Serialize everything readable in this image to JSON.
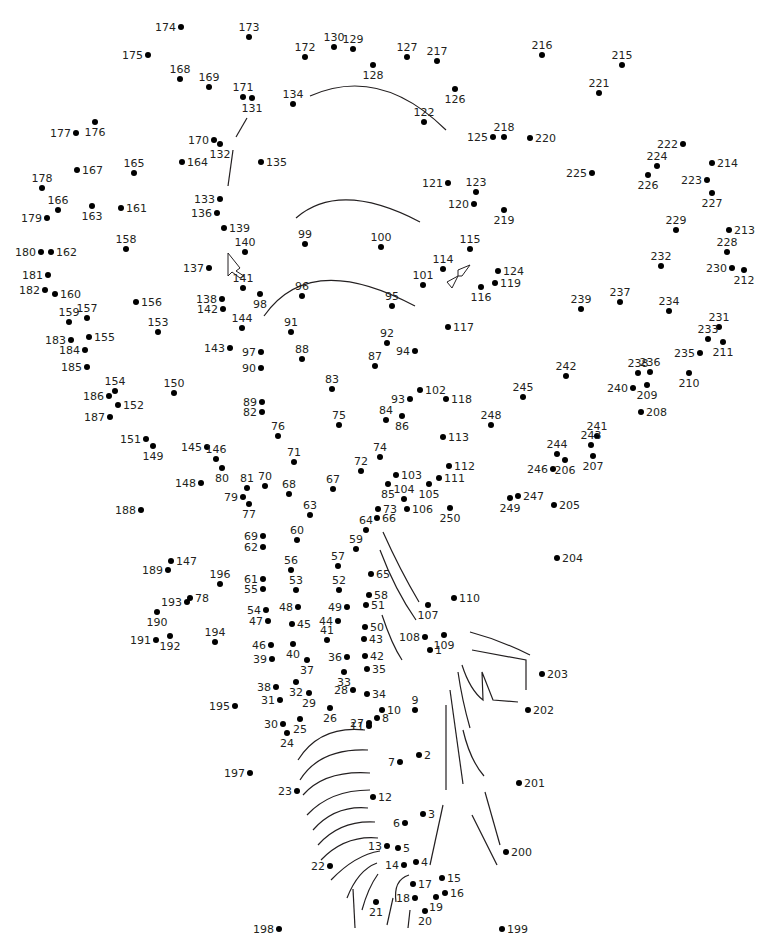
{
  "puzzle": {
    "type": "connect-the-dots",
    "dot_count": 250,
    "colors": {
      "dot": "#000000",
      "label": "#231f20",
      "line": "#231f20",
      "background": "#ffffff"
    }
  },
  "dots": [
    [
      1,
      430,
      650,
      "r"
    ],
    [
      2,
      419,
      755,
      "r"
    ],
    [
      3,
      423,
      814,
      "r"
    ],
    [
      4,
      416,
      862,
      "r"
    ],
    [
      5,
      398,
      848,
      "r"
    ],
    [
      6,
      405,
      823,
      "l"
    ],
    [
      7,
      400,
      762,
      "l"
    ],
    [
      8,
      377,
      718,
      "r"
    ],
    [
      9,
      415,
      710,
      "t"
    ],
    [
      10,
      382,
      710,
      "r"
    ],
    [
      11,
      369,
      726,
      "l"
    ],
    [
      12,
      373,
      797,
      "r"
    ],
    [
      13,
      387,
      846,
      "l"
    ],
    [
      14,
      404,
      865,
      "l"
    ],
    [
      15,
      442,
      878,
      "r"
    ],
    [
      16,
      445,
      893,
      "r"
    ],
    [
      17,
      413,
      884,
      "r"
    ],
    [
      18,
      415,
      898,
      "l"
    ],
    [
      19,
      436,
      897,
      "b"
    ],
    [
      20,
      425,
      911,
      "b"
    ],
    [
      21,
      376,
      902,
      "b"
    ],
    [
      22,
      330,
      866,
      "l"
    ],
    [
      23,
      297,
      791,
      "l"
    ],
    [
      24,
      287,
      733,
      "b"
    ],
    [
      25,
      300,
      719,
      "b"
    ],
    [
      26,
      330,
      708,
      "b"
    ],
    [
      27,
      369,
      723,
      "l"
    ],
    [
      28,
      353,
      690,
      "l"
    ],
    [
      29,
      309,
      693,
      "b"
    ],
    [
      30,
      283,
      724,
      "l"
    ],
    [
      31,
      280,
      700,
      "l"
    ],
    [
      32,
      296,
      682,
      "b"
    ],
    [
      33,
      344,
      672,
      "b"
    ],
    [
      34,
      367,
      694,
      "r"
    ],
    [
      35,
      367,
      669,
      "r"
    ],
    [
      36,
      347,
      657,
      "l"
    ],
    [
      37,
      307,
      660,
      "b"
    ],
    [
      38,
      276,
      687,
      "l"
    ],
    [
      39,
      272,
      659,
      "l"
    ],
    [
      40,
      293,
      644,
      "b"
    ],
    [
      41,
      327,
      640,
      "t"
    ],
    [
      42,
      365,
      656,
      "r"
    ],
    [
      43,
      364,
      639,
      "r"
    ],
    [
      44,
      338,
      621,
      "l"
    ],
    [
      45,
      292,
      624,
      "r"
    ],
    [
      46,
      271,
      645,
      "l"
    ],
    [
      47,
      268,
      621,
      "l"
    ],
    [
      48,
      298,
      607,
      "l"
    ],
    [
      49,
      347,
      607,
      "l"
    ],
    [
      50,
      365,
      627,
      "r"
    ],
    [
      51,
      366,
      605,
      "r"
    ],
    [
      52,
      339,
      590,
      "t"
    ],
    [
      53,
      296,
      590,
      "t"
    ],
    [
      54,
      266,
      610,
      "l"
    ],
    [
      55,
      263,
      589,
      "l"
    ],
    [
      56,
      291,
      570,
      "t"
    ],
    [
      57,
      338,
      566,
      "t"
    ],
    [
      58,
      369,
      595,
      "r"
    ],
    [
      59,
      356,
      549,
      "t"
    ],
    [
      60,
      297,
      540,
      "t"
    ],
    [
      61,
      263,
      579,
      "l"
    ],
    [
      62,
      263,
      547,
      "l"
    ],
    [
      63,
      310,
      515,
      "t"
    ],
    [
      64,
      366,
      530,
      "t"
    ],
    [
      65,
      371,
      574,
      "r"
    ],
    [
      66,
      377,
      518,
      "r"
    ],
    [
      67,
      333,
      489,
      "t"
    ],
    [
      68,
      289,
      494,
      "t"
    ],
    [
      69,
      263,
      536,
      "l"
    ],
    [
      70,
      265,
      486,
      "t"
    ],
    [
      71,
      294,
      462,
      "t"
    ],
    [
      72,
      361,
      471,
      "t"
    ],
    [
      73,
      378,
      509,
      "r"
    ],
    [
      74,
      380,
      457,
      "t"
    ],
    [
      75,
      339,
      425,
      "t"
    ],
    [
      76,
      278,
      436,
      "t"
    ],
    [
      77,
      249,
      504,
      "b"
    ],
    [
      78,
      190,
      598,
      "r"
    ],
    [
      79,
      243,
      497,
      "l"
    ],
    [
      80,
      222,
      468,
      "b"
    ],
    [
      81,
      247,
      488,
      "t"
    ],
    [
      82,
      262,
      412,
      "l"
    ],
    [
      83,
      332,
      389,
      "t"
    ],
    [
      84,
      386,
      420,
      "t"
    ],
    [
      85,
      388,
      484,
      "b"
    ],
    [
      86,
      402,
      416,
      "b"
    ],
    [
      87,
      375,
      366,
      "t"
    ],
    [
      88,
      302,
      359,
      "t"
    ],
    [
      89,
      262,
      402,
      "l"
    ],
    [
      90,
      261,
      368,
      "l"
    ],
    [
      91,
      291,
      332,
      "t"
    ],
    [
      92,
      387,
      343,
      "t"
    ],
    [
      93,
      410,
      399,
      "l"
    ],
    [
      94,
      415,
      351,
      "l"
    ],
    [
      95,
      392,
      306,
      "t"
    ],
    [
      96,
      302,
      296,
      "t"
    ],
    [
      97,
      261,
      352,
      "l"
    ],
    [
      98,
      260,
      294,
      "b"
    ],
    [
      99,
      305,
      244,
      "t"
    ],
    [
      100,
      381,
      247,
      "t"
    ],
    [
      101,
      423,
      285,
      "t"
    ],
    [
      102,
      420,
      390,
      "r"
    ],
    [
      103,
      396,
      475,
      "r"
    ],
    [
      104,
      404,
      499,
      "t"
    ],
    [
      105,
      429,
      484,
      "b"
    ],
    [
      106,
      407,
      509,
      "r"
    ],
    [
      107,
      428,
      605,
      "b"
    ],
    [
      108,
      425,
      637,
      "l"
    ],
    [
      109,
      444,
      635,
      "b"
    ],
    [
      110,
      454,
      598,
      "r"
    ],
    [
      111,
      439,
      478,
      "r"
    ],
    [
      112,
      449,
      466,
      "r"
    ],
    [
      113,
      443,
      437,
      "r"
    ],
    [
      114,
      443,
      269,
      "t"
    ],
    [
      115,
      470,
      249,
      "t"
    ],
    [
      116,
      481,
      287,
      "b"
    ],
    [
      117,
      448,
      327,
      "r"
    ],
    [
      118,
      446,
      399,
      "r"
    ],
    [
      119,
      495,
      283,
      "r"
    ],
    [
      120,
      474,
      204,
      "l"
    ],
    [
      121,
      448,
      183,
      "l"
    ],
    [
      122,
      424,
      122,
      "t"
    ],
    [
      123,
      476,
      192,
      "t"
    ],
    [
      124,
      498,
      271,
      "r"
    ],
    [
      125,
      493,
      137,
      "l"
    ],
    [
      126,
      455,
      89,
      "b"
    ],
    [
      127,
      407,
      57,
      "t"
    ],
    [
      128,
      373,
      65,
      "b"
    ],
    [
      129,
      353,
      49,
      "t"
    ],
    [
      130,
      334,
      47,
      "t"
    ],
    [
      131,
      252,
      98,
      "b"
    ],
    [
      132,
      220,
      144,
      "b"
    ],
    [
      133,
      220,
      199,
      "l"
    ],
    [
      134,
      293,
      104,
      "t"
    ],
    [
      135,
      261,
      162,
      "r"
    ],
    [
      136,
      217,
      213,
      "l"
    ],
    [
      137,
      209,
      268,
      "l"
    ],
    [
      138,
      222,
      299,
      "l"
    ],
    [
      139,
      224,
      228,
      "r"
    ],
    [
      140,
      245,
      252,
      "t"
    ],
    [
      141,
      243,
      288,
      "t"
    ],
    [
      142,
      223,
      309,
      "l"
    ],
    [
      143,
      230,
      348,
      "l"
    ],
    [
      144,
      242,
      328,
      "t"
    ],
    [
      145,
      207,
      447,
      "l"
    ],
    [
      146,
      216,
      459,
      "t"
    ],
    [
      147,
      171,
      561,
      "r"
    ],
    [
      148,
      201,
      483,
      "l"
    ],
    [
      149,
      153,
      446,
      "b"
    ],
    [
      150,
      174,
      393,
      "t"
    ],
    [
      151,
      146,
      439,
      "l"
    ],
    [
      152,
      118,
      405,
      "r"
    ],
    [
      153,
      158,
      332,
      "t"
    ],
    [
      154,
      115,
      391,
      "t"
    ],
    [
      155,
      89,
      337,
      "r"
    ],
    [
      156,
      136,
      302,
      "r"
    ],
    [
      157,
      87,
      318,
      "t"
    ],
    [
      158,
      126,
      249,
      "t"
    ],
    [
      159,
      69,
      322,
      "t"
    ],
    [
      160,
      55,
      294,
      "r"
    ],
    [
      161,
      121,
      208,
      "r"
    ],
    [
      162,
      51,
      252,
      "r"
    ],
    [
      163,
      92,
      206,
      "b"
    ],
    [
      164,
      182,
      162,
      "r"
    ],
    [
      165,
      134,
      173,
      "t"
    ],
    [
      166,
      58,
      210,
      "t"
    ],
    [
      167,
      77,
      170,
      "r"
    ],
    [
      168,
      180,
      79,
      "t"
    ],
    [
      169,
      209,
      87,
      "t"
    ],
    [
      170,
      214,
      140,
      "l"
    ],
    [
      171,
      243,
      97,
      "t"
    ],
    [
      172,
      305,
      57,
      "t"
    ],
    [
      173,
      249,
      37,
      "t"
    ],
    [
      174,
      181,
      27,
      "l"
    ],
    [
      175,
      148,
      55,
      "l"
    ],
    [
      176,
      95,
      122,
      "b"
    ],
    [
      177,
      76,
      133,
      "l"
    ],
    [
      178,
      42,
      188,
      "t"
    ],
    [
      179,
      47,
      218,
      "l"
    ],
    [
      180,
      41,
      252,
      "l"
    ],
    [
      181,
      48,
      275,
      "l"
    ],
    [
      182,
      45,
      290,
      "l"
    ],
    [
      183,
      71,
      340,
      "l"
    ],
    [
      184,
      85,
      350,
      "l"
    ],
    [
      185,
      87,
      367,
      "l"
    ],
    [
      186,
      109,
      396,
      "l"
    ],
    [
      187,
      110,
      417,
      "l"
    ],
    [
      188,
      141,
      510,
      "l"
    ],
    [
      189,
      168,
      570,
      "l"
    ],
    [
      190,
      157,
      612,
      "b"
    ],
    [
      191,
      156,
      640,
      "l"
    ],
    [
      192,
      170,
      636,
      "b"
    ],
    [
      193,
      187,
      602,
      "l"
    ],
    [
      194,
      215,
      642,
      "t"
    ],
    [
      195,
      235,
      706,
      "l"
    ],
    [
      196,
      220,
      584,
      "t"
    ],
    [
      197,
      250,
      773,
      "l"
    ],
    [
      198,
      279,
      929,
      "l"
    ],
    [
      199,
      502,
      929,
      "r"
    ],
    [
      200,
      506,
      852,
      "r"
    ],
    [
      201,
      519,
      783,
      "r"
    ],
    [
      202,
      528,
      710,
      "r"
    ],
    [
      203,
      542,
      674,
      "r"
    ],
    [
      204,
      557,
      558,
      "r"
    ],
    [
      205,
      554,
      505,
      "r"
    ],
    [
      206,
      565,
      460,
      "b"
    ],
    [
      207,
      593,
      456,
      "b"
    ],
    [
      208,
      641,
      412,
      "r"
    ],
    [
      209,
      647,
      385,
      "b"
    ],
    [
      210,
      689,
      373,
      "b"
    ],
    [
      211,
      723,
      342,
      "b"
    ],
    [
      212,
      744,
      270,
      "b"
    ],
    [
      213,
      729,
      230,
      "r"
    ],
    [
      214,
      712,
      163,
      "r"
    ],
    [
      215,
      622,
      65,
      "t"
    ],
    [
      216,
      542,
      55,
      "t"
    ],
    [
      217,
      437,
      61,
      "t"
    ],
    [
      218,
      504,
      137,
      "t"
    ],
    [
      219,
      504,
      210,
      "b"
    ],
    [
      220,
      530,
      138,
      "r"
    ],
    [
      221,
      599,
      93,
      "t"
    ],
    [
      222,
      683,
      144,
      "l"
    ],
    [
      223,
      707,
      180,
      "l"
    ],
    [
      224,
      657,
      166,
      "t"
    ],
    [
      225,
      592,
      173,
      "l"
    ],
    [
      226,
      648,
      175,
      "b"
    ],
    [
      227,
      712,
      193,
      "b"
    ],
    [
      228,
      727,
      252,
      "t"
    ],
    [
      229,
      676,
      230,
      "t"
    ],
    [
      230,
      732,
      268,
      "l"
    ],
    [
      231,
      719,
      327,
      "t"
    ],
    [
      232,
      661,
      266,
      "t"
    ],
    [
      233,
      708,
      339,
      "t"
    ],
    [
      234,
      669,
      311,
      "t"
    ],
    [
      235,
      700,
      353,
      "l"
    ],
    [
      236,
      650,
      372,
      "t"
    ],
    [
      237,
      620,
      302,
      "t"
    ],
    [
      238,
      638,
      373,
      "t"
    ],
    [
      239,
      581,
      309,
      "t"
    ],
    [
      240,
      633,
      388,
      "l"
    ],
    [
      241,
      597,
      436,
      "t"
    ],
    [
      242,
      566,
      376,
      "t"
    ],
    [
      243,
      591,
      445,
      "t"
    ],
    [
      244,
      557,
      454,
      "t"
    ],
    [
      245,
      523,
      397,
      "t"
    ],
    [
      246,
      553,
      469,
      "l"
    ],
    [
      247,
      518,
      496,
      "r"
    ],
    [
      248,
      491,
      425,
      "t"
    ],
    [
      249,
      510,
      498,
      "b"
    ],
    [
      250,
      450,
      508,
      "b"
    ]
  ],
  "guide_strokes": [
    "M310,96 Q380,65 446,130",
    "M296,218 Q340,180 420,222",
    "M264,316 Q310,250 415,306",
    "M228,186 L233,150",
    "M236,137 L247,118",
    "M383,532 Q400,570 419,602",
    "M380,550 Q395,590 416,620",
    "M382,615 Q392,645 402,660",
    "M470,632 Q500,640 530,655",
    "M472,650 L526,660 L526,690",
    "M462,665 Q470,690 483,700 L482,672 L493,700 L518,702",
    "M458,672 Q462,700 470,728",
    "M450,690 L463,784",
    "M463,730 Q470,760 484,776",
    "M446,705 L446,790",
    "M485,792 L500,845",
    "M472,815 L497,865",
    "M443,805 L430,865",
    "M298,760 Q320,725 365,730",
    "M300,780 Q320,748 368,750",
    "M303,795 Q325,770 370,773",
    "M307,815 Q330,790 370,790",
    "M313,830 Q335,805 368,808",
    "M318,845 Q340,820 375,822",
    "M321,860 Q345,835 378,838",
    "M331,880 Q355,855 380,851",
    "M347,898 Q358,870 377,863",
    "M362,910 Q368,888 378,874",
    "M353,889 L355,928",
    "M393,898 L387,925",
    "M409,875 Q393,880 396,902",
    "M410,910 L408,928"
  ],
  "cursor_shapes": [
    "M228,253 L240,268 L236,271 L244,276 L240,278 L232,272 L228,276 Z",
    "M447,282 L458,276 L458,270 L470,265 L462,276 L458,276 L452,288 Z"
  ]
}
